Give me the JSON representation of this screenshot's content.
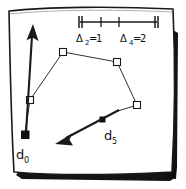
{
  "figure": {
    "background_color": "#ffffff",
    "ink_color": "#1a1a1a",
    "shadow_color": "#121212",
    "border": {
      "style": "hand-drawn-wobbly-rectangle",
      "stroke_color": "#1a1a1a",
      "has_drop_shadow": true,
      "shadow_edges": "right-and-bottom"
    },
    "scale_bar": {
      "name": "scale-bar",
      "end_cap_style": "double-tick",
      "inner_tick_count": 2,
      "labels": [
        {
          "text": "Δ2=1",
          "symbol": "Δ",
          "subscript": "2",
          "equals": "=",
          "value": "1"
        },
        {
          "text": "Δ4=2",
          "symbol": "Δ",
          "subscript": "4",
          "equals": "=",
          "value": "2"
        }
      ]
    },
    "markers": [
      {
        "id": "d0",
        "label": "d",
        "subscript": "0",
        "style": "filled-square",
        "x": 25,
        "y": 135
      },
      {
        "id": "d5",
        "label": "d",
        "subscript": "5",
        "style": "filled-square-small",
        "x": 103,
        "y": 120
      }
    ],
    "vertices": [
      {
        "id": "v1",
        "style": "open-square",
        "x": 30,
        "y": 100
      },
      {
        "id": "v2",
        "style": "open-square",
        "x": 63,
        "y": 52
      },
      {
        "id": "v3",
        "style": "open-square",
        "x": 117,
        "y": 62
      },
      {
        "id": "v4",
        "style": "open-square",
        "x": 137,
        "y": 105
      }
    ],
    "arrows": [
      {
        "id": "arrow-d0",
        "direction": "up",
        "from_x": 25,
        "from_y": 135,
        "to_x": 33,
        "to_y": 28,
        "weight": "thick"
      },
      {
        "id": "arrow-d5",
        "direction": "down-left",
        "from_x": 118,
        "from_y": 111,
        "to_x": 57,
        "to_y": 142,
        "weight": "thick"
      }
    ],
    "polyline_path": "30,100 63,52 117,62 137,105",
    "caption_labels": [
      "d0",
      "d5"
    ]
  }
}
